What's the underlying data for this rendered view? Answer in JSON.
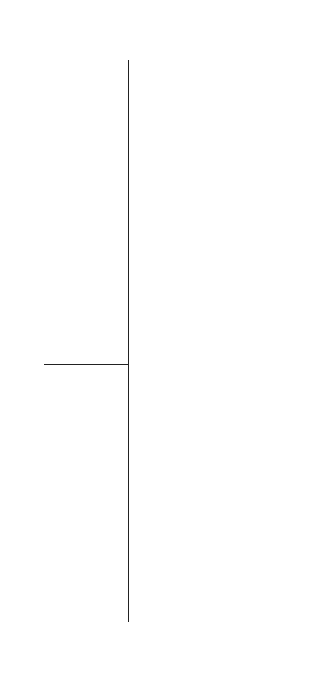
{
  "station_label": "Work Station",
  "leader_label": "(Leader)",
  "observer_label": "(Observer)",
  "stations": [
    {
      "number": "1",
      "leader": "1",
      "leader_circled": false,
      "children": [
        {
          "n": "5",
          "c": true
        },
        {
          "n": "6",
          "c": true
        },
        {
          "n": "7",
          "c": true
        }
      ],
      "observer": "29"
    },
    {
      "number": "2",
      "leader": "2",
      "leader_circled": false,
      "children": [
        {
          "n": "8",
          "c": false
        },
        {
          "n": "9",
          "c": true
        },
        {
          "n": "10",
          "c": true
        }
      ],
      "observer": "30"
    },
    {
      "number": "3",
      "leader": "3",
      "leader_circled": true,
      "children": [
        {
          "n": "11",
          "c": false
        },
        {
          "n": "12",
          "c": false
        },
        {
          "n": "13",
          "c": true
        }
      ],
      "observer": "31"
    },
    {
      "number": "4",
      "leader": "4",
      "leader_circled": true,
      "children": [
        {
          "n": "14",
          "c": true
        },
        {
          "n": "15",
          "c": false
        },
        {
          "n": "16",
          "c": true
        }
      ],
      "observer": "32"
    },
    {
      "number": "5",
      "leader": "17",
      "leader_circled": false,
      "children": [
        {
          "n": "19",
          "c": false
        },
        {
          "n": "20",
          "c": false
        },
        {
          "n": "21",
          "c": false
        }
      ],
      "observer": "33"
    },
    {
      "number": "6",
      "leader": "18",
      "leader_circled": true,
      "children": [
        {
          "n": "22",
          "c": true
        },
        {
          "n": "23",
          "c": true
        },
        {
          "n": "24",
          "c": true
        }
      ],
      "observer": "34"
    },
    {
      "number": "7",
      "leader": "25",
      "leader_circled": false,
      "children": [
        {
          "n": "26",
          "c": false
        },
        {
          "n": "27",
          "c": false
        },
        {
          "n": "28",
          "c": true
        }
      ],
      "observer": "35"
    }
  ],
  "colors": {
    "ink": "#222222",
    "background": "#ffffff"
  }
}
